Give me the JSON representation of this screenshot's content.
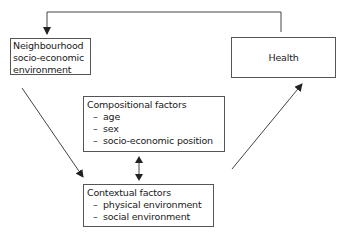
{
  "diagram": {
    "nodes": {
      "neighbourhood": {
        "lines": [
          "Neighbourhood",
          "socio-economic",
          "environment"
        ]
      },
      "health": {
        "label": "Health"
      },
      "compositional": {
        "title": "Compositional factors",
        "items": [
          "age",
          "sex",
          "socio-economic position"
        ]
      },
      "contextual": {
        "title": "Contextual factors",
        "items": [
          "physical environment",
          "social environment"
        ]
      }
    },
    "bullet": "–",
    "edges": [
      {
        "from": "health",
        "to": "neighbourhood",
        "type": "feedback-loop"
      },
      {
        "from": "neighbourhood",
        "to": "contextual",
        "type": "arrow"
      },
      {
        "from": "compositional",
        "to": "contextual",
        "type": "bidirectional"
      },
      {
        "from": "contextual",
        "to": "health",
        "type": "arrow"
      }
    ],
    "colors": {
      "line": "#444444",
      "border": "#555555",
      "text": "#1a1a1a"
    }
  }
}
